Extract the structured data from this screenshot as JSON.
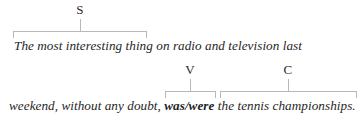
{
  "figure": {
    "type": "sentence-constituent-diagram",
    "colors": {
      "background": "#ffffff",
      "text": "#1f1f1f",
      "bracket": "#b8b8b8",
      "label": "#2b2b2b"
    },
    "rows": [
      {
        "id": "row-1",
        "labels": [
          {
            "id": "S",
            "text": "S",
            "meaning": "subject"
          }
        ],
        "text_parts": [
          {
            "text": "The most interesting thing on radio and television last",
            "bold": false
          }
        ],
        "text_full": "The most interesting thing on radio and television last"
      },
      {
        "id": "row-2",
        "labels": [
          {
            "id": "V",
            "text": "V",
            "meaning": "verb"
          },
          {
            "id": "C",
            "text": "C",
            "meaning": "complement"
          }
        ],
        "text_parts": [
          {
            "text": "weekend, without any doubt, ",
            "bold": false
          },
          {
            "text": "was/were",
            "bold": true
          },
          {
            "text": " the tennis championships.",
            "bold": false
          }
        ],
        "text_full": "weekend, without any doubt, was/were the tennis championships."
      }
    ],
    "sentence": "The most interesting thing on radio and television last weekend, without any doubt, was/were the tennis championships."
  }
}
